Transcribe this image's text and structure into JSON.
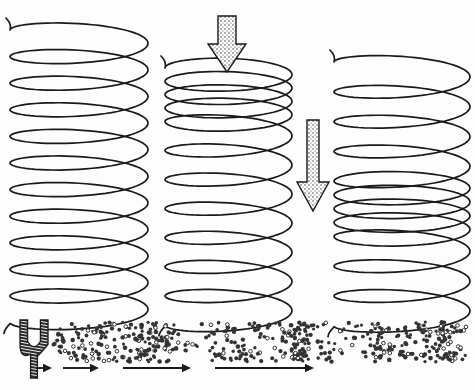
{
  "figure": {
    "type": "physics-diagram",
    "background_color": "#fdfdfd",
    "ink_color": "#1a1a1a",
    "stipple_color": "#333333",
    "panel_count": 2
  },
  "springs": [
    {
      "name": "spring-relaxed",
      "label": "",
      "state": "relaxed",
      "x_left": 10,
      "x_right": 148,
      "y_top": 30,
      "y_bottom": 296,
      "coil_count": 11,
      "coil_spacing_px": 24,
      "compression_zone": null
    },
    {
      "name": "spring-compressed-top",
      "label": "",
      "state": "compressed-at-top",
      "x_left": 165,
      "x_right": 292,
      "y_top": 68,
      "y_bottom": 296,
      "coil_count": 11,
      "coil_spacing_px": 24,
      "compression_zone": {
        "from_coil": 0,
        "to_coil": 4,
        "spacing_px": 11
      }
    },
    {
      "name": "spring-compressed-middle",
      "label": "",
      "state": "compressed-in-middle",
      "x_left": 334,
      "x_right": 470,
      "y_top": 62,
      "y_bottom": 296,
      "coil_count": 11,
      "coil_spacing_px": 26,
      "compression_zone": {
        "from_coil": 4,
        "to_coil": 8,
        "spacing_px": 12
      }
    }
  ],
  "arrows": [
    {
      "name": "force-arrow-initial",
      "label": "",
      "direction": "down",
      "fill": "stipple",
      "shaft": {
        "x": 218,
        "y_top": 16,
        "y_bottom": 48,
        "width": 18
      },
      "head": {
        "y_top": 44,
        "y_tip": 72,
        "width": 38
      }
    },
    {
      "name": "pulse-travel-arrow",
      "label": "",
      "direction": "down",
      "fill": "stipple",
      "shaft": {
        "x": 307,
        "y_top": 120,
        "y_bottom": 185,
        "width": 12
      },
      "head": {
        "y_top": 182,
        "y_tip": 211,
        "width": 32
      }
    }
  ],
  "sound_panel": {
    "name": "sound-wave-panel",
    "x": 8,
    "y": 318,
    "width": 460,
    "height": 62,
    "tuning_fork": {
      "name": "tuning-fork",
      "label": "",
      "x": 20,
      "y": 320,
      "width": 28,
      "height": 58,
      "prong_count": 2,
      "hatched": true
    },
    "molecule_field": {
      "name": "air-molecule-field",
      "x_start": 52,
      "x_end": 468,
      "y_top": 322,
      "y_bottom": 362,
      "dot_radius_px": 1.9,
      "base_density": "uniform-sparse",
      "compression_centers_x": [
        95,
        148,
        232,
        300,
        378,
        440
      ],
      "compression_peak_x": [
        148,
        300,
        440
      ],
      "total_dots_approx": 520
    },
    "propagation_arrows": [
      {
        "name": "propagation-arrow-1",
        "x_start": 36,
        "x_end": 52,
        "y": 368,
        "length_px": 16
      },
      {
        "name": "propagation-arrow-2",
        "x_start": 63,
        "x_end": 99,
        "y": 368,
        "length_px": 36
      },
      {
        "name": "propagation-arrow-3",
        "x_start": 123,
        "x_end": 191,
        "y": 368,
        "length_px": 68
      },
      {
        "name": "propagation-arrow-4",
        "x_start": 215,
        "x_end": 314,
        "y": 368,
        "length_px": 99
      }
    ]
  }
}
